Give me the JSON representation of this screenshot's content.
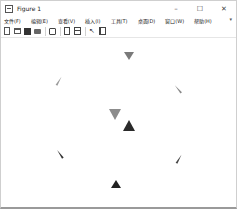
{
  "window": {
    "title": "Figure 1",
    "controls": {
      "minimize": "–",
      "maximize": "☐",
      "close": "✕"
    }
  },
  "menubar": {
    "items": [
      {
        "label": "文件(F)"
      },
      {
        "label": "编辑(E)"
      },
      {
        "label": "查看(V)"
      },
      {
        "label": "插入(I)"
      },
      {
        "label": "工具(T)"
      },
      {
        "label": "桌面(D)"
      },
      {
        "label": "窗口(W)"
      },
      {
        "label": "帮助(H)"
      }
    ],
    "overflow_glyph": "▾"
  },
  "toolbar": {
    "buttons": [
      {
        "name": "new-figure",
        "icon": "new-file-icon"
      },
      {
        "name": "open-file",
        "icon": "open-folder-icon"
      },
      {
        "name": "save-figure",
        "icon": "save-icon"
      },
      {
        "name": "print-figure",
        "icon": "print-icon"
      },
      {
        "name": "link-plot",
        "icon": "link-plot-icon"
      },
      {
        "name": "insert-colorbar",
        "icon": "document-icon"
      },
      {
        "name": "insert-legend",
        "icon": "legend-panel-icon"
      },
      {
        "name": "edit-plot",
        "icon": "pointer-icon",
        "glyph": "↖"
      },
      {
        "name": "property-editor",
        "icon": "property-editor-icon"
      }
    ]
  },
  "plot": {
    "markers": [
      {
        "x": 128,
        "y": 56,
        "shape": "triangle-down",
        "size": 10,
        "color": "#7a7a7a",
        "rotation": 0
      },
      {
        "x": 62,
        "y": 80,
        "shape": "sliver",
        "size": 10,
        "color": "#9a9a9a",
        "rotation": 30
      },
      {
        "x": 181,
        "y": 88,
        "shape": "sliver",
        "size": 10,
        "color": "#8a8a8a",
        "rotation": -40
      },
      {
        "x": 114,
        "y": 114,
        "shape": "triangle-down",
        "size": 13,
        "color": "#8c8c8c",
        "rotation": 0
      },
      {
        "x": 128,
        "y": 125,
        "shape": "triangle-up",
        "size": 13,
        "color": "#2a2a2a",
        "rotation": 0
      },
      {
        "x": 63,
        "y": 153,
        "shape": "sliver",
        "size": 10,
        "color": "#333333",
        "rotation": -35
      },
      {
        "x": 182,
        "y": 158,
        "shape": "sliver",
        "size": 10,
        "color": "#444444",
        "rotation": 30
      },
      {
        "x": 115,
        "y": 184,
        "shape": "triangle-up",
        "size": 10,
        "color": "#222222",
        "rotation": 0
      }
    ]
  }
}
